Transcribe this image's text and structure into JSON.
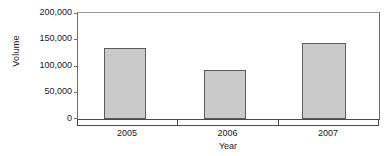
{
  "chart_data": {
    "type": "bar",
    "title": "",
    "xlabel": "Year",
    "ylabel": "Volume",
    "categories": [
      "2005",
      "2006",
      "2007"
    ],
    "values": [
      134000,
      92500,
      143000
    ],
    "ylim": [
      0,
      200000
    ],
    "ytick_labels": [
      "200,000",
      "150,000",
      "100,000",
      "50,000",
      "0"
    ],
    "ytick_values": [
      200000,
      150000,
      100000,
      50000,
      0
    ],
    "grid": false,
    "legend": "none",
    "series": [
      {
        "name": "Volume",
        "values": [
          134000,
          92500,
          143000
        ]
      }
    ]
  },
  "style": {
    "bar_fill": "#cacaca",
    "bar_stroke": "#5d5d5d",
    "axis_color": "#4a4a4a",
    "text_color": "#1a1a1a",
    "background": "#ffffff"
  }
}
